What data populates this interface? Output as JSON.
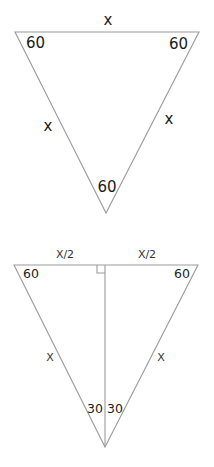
{
  "diagram": {
    "equilateral_triangle": {
      "side_labels": {
        "top": "x",
        "left": "x",
        "right": "x"
      },
      "angle_labels": {
        "top_left": "60",
        "top_right": "60",
        "bottom": "60"
      }
    },
    "bisected_triangle": {
      "half_base_labels": {
        "left": "X/2",
        "right": "X/2"
      },
      "side_labels": {
        "left": "X",
        "right": "X"
      },
      "angle_labels": {
        "top_left": "60",
        "top_right": "60",
        "bottom_left_half": "30",
        "bottom_right_half": "30"
      },
      "right_angle_marker": "right-angle-symbol"
    },
    "colors": {
      "line": "#9a9a9a",
      "text": "#1a1a1a",
      "background": "#ffffff"
    }
  }
}
